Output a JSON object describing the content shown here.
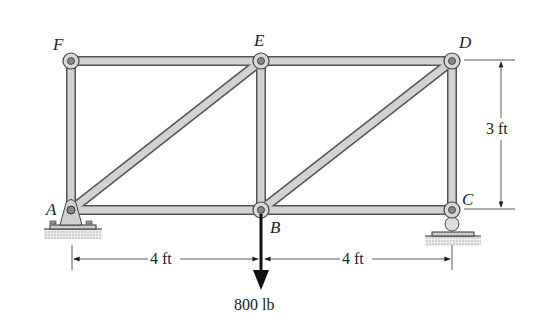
{
  "joints": {
    "A": {
      "label": "A",
      "x": 71,
      "y": 210
    },
    "B": {
      "label": "B",
      "x": 261,
      "y": 210
    },
    "C": {
      "label": "C",
      "x": 452,
      "y": 210
    },
    "D": {
      "label": "D",
      "x": 452,
      "y": 61
    },
    "E": {
      "label": "E",
      "x": 261,
      "y": 61
    },
    "F": {
      "label": "F",
      "x": 71,
      "y": 61
    }
  },
  "members": [
    "AF",
    "FE",
    "ED",
    "DC",
    "CB",
    "BA",
    "EB",
    "AE",
    "BD"
  ],
  "supports": {
    "A": "pin",
    "C": "roller"
  },
  "load": {
    "joint": "B",
    "value": "800 lb",
    "direction": "down"
  },
  "dimensions": {
    "span_AB": "4 ft",
    "span_BC": "4 ft",
    "height_CD": "3 ft"
  },
  "colors": {
    "member": "#cfcfcf",
    "member_edge": "#555555",
    "text": "#222222"
  }
}
